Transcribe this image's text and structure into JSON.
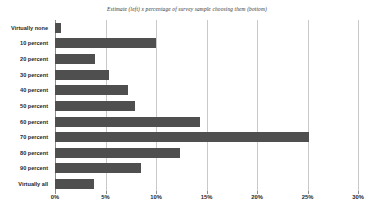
{
  "chart_data": {
    "type": "bar",
    "orientation": "horizontal",
    "title": "Estimate (left) x percentage of survey sample choosing them (bottom)",
    "xlabel": "",
    "ylabel": "",
    "categories": [
      "Virtually none",
      "10 percent",
      "20 percent",
      "30 percent",
      "40 percent",
      "50 percent",
      "60 percent",
      "70 percent",
      "80 percent",
      "90 percent",
      "Virtually all"
    ],
    "values": [
      0.6,
      10.0,
      4.0,
      5.3,
      7.2,
      7.9,
      14.4,
      25.1,
      12.4,
      8.5,
      3.9
    ],
    "xlim": [
      0,
      30
    ],
    "xticks": [
      0,
      5,
      10,
      15,
      20,
      25,
      30
    ],
    "xtick_labels": [
      "0%",
      "5%",
      "10%",
      "15%",
      "20%",
      "25%",
      "30%"
    ],
    "grid": true,
    "legend": false,
    "bar_color": "#4f4f4f",
    "gridline_color": "#c9c9c9",
    "axis_color": "#8d8d8d",
    "background_color": "#ffffff"
  }
}
